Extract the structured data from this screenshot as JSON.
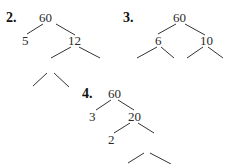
{
  "trees": [
    {
      "label": "2.",
      "nodes": {
        "root": "60",
        "left": "5",
        "right": "12"
      },
      "edges": [
        [
          "root",
          "left"
        ],
        [
          "root",
          "right"
        ],
        [
          "right",
          "blank-a"
        ],
        [
          "right",
          "blank-b"
        ],
        [
          "blank-c",
          "blank-d"
        ],
        [
          "blank-c",
          "blank-e"
        ]
      ]
    },
    {
      "label": "3.",
      "nodes": {
        "root": "60",
        "left": "6",
        "right": "10"
      },
      "edges": [
        [
          "root",
          "left"
        ],
        [
          "root",
          "right"
        ],
        [
          "left",
          "blank-a"
        ],
        [
          "left",
          "blank-b"
        ],
        [
          "right",
          "blank-c"
        ],
        [
          "right",
          "blank-d"
        ]
      ]
    },
    {
      "label": "4.",
      "nodes": {
        "root": "60",
        "left": "3",
        "right": "20",
        "right_left": "2"
      },
      "edges": [
        [
          "root",
          "left"
        ],
        [
          "root",
          "right"
        ],
        [
          "right",
          "right_left"
        ],
        [
          "right",
          "blank-a"
        ],
        [
          "blank-a",
          "blank-b"
        ],
        [
          "blank-a",
          "blank-c"
        ]
      ]
    }
  ]
}
